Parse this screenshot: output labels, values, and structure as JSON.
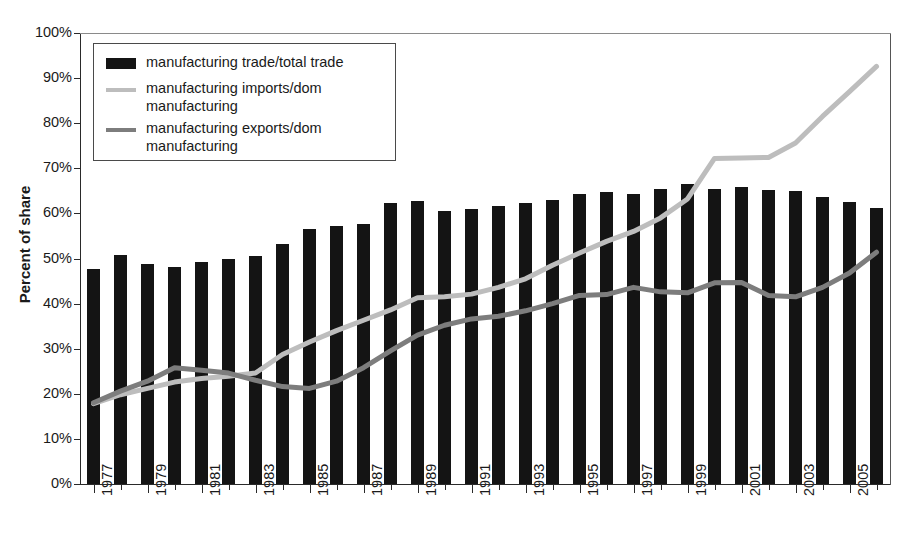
{
  "chart_data": {
    "type": "bar",
    "title": "",
    "xlabel": "",
    "ylabel": "Percent of share",
    "ylim": [
      0,
      100
    ],
    "ytick_labels": [
      "0%",
      "10%",
      "20%",
      "30%",
      "40%",
      "50%",
      "60%",
      "70%",
      "80%",
      "90%",
      "100%"
    ],
    "ytick_values": [
      0,
      10,
      20,
      30,
      40,
      50,
      60,
      70,
      80,
      90,
      100
    ],
    "grid": false,
    "legend_position": "upper-left inside plot",
    "categories": [
      1977,
      1978,
      1979,
      1980,
      1981,
      1982,
      1983,
      1984,
      1985,
      1986,
      1987,
      1988,
      1989,
      1990,
      1991,
      1992,
      1993,
      1994,
      1995,
      1996,
      1997,
      1998,
      1999,
      2000,
      2001,
      2002,
      2003,
      2004,
      2005,
      2006
    ],
    "xtick_labels": [
      "1977",
      "1979",
      "1981",
      "1983",
      "1985",
      "1987",
      "1989",
      "1991",
      "1993",
      "1995",
      "1997",
      "1999",
      "2001",
      "2003",
      "2005"
    ],
    "series": [
      {
        "name": "manufacturing trade/total trade",
        "kind": "bar",
        "color": "#141414",
        "values": [
          47.6,
          50.7,
          48.8,
          48.2,
          49.3,
          49.8,
          50.6,
          53.2,
          56.5,
          57.3,
          57.6,
          62.4,
          62.7,
          60.5,
          61.0,
          61.6,
          62.4,
          63.0,
          64.4,
          64.7,
          64.3,
          65.4,
          66.6,
          65.4,
          65.8,
          65.2,
          65.0,
          63.6,
          62.5,
          61.3
        ]
      },
      {
        "name": "manufacturing imports/dom manufacturing",
        "kind": "line",
        "color": "#bdbdbd",
        "values": [
          17.8,
          19.8,
          21.2,
          22.6,
          23.4,
          23.9,
          24.6,
          28.7,
          31.5,
          34.0,
          36.3,
          38.6,
          41.3,
          41.5,
          42.1,
          43.6,
          45.5,
          48.5,
          51.2,
          53.8,
          56.0,
          59.0,
          63.2,
          72.2,
          72.3,
          72.4,
          75.6,
          81.5,
          87.0,
          92.6
        ]
      },
      {
        "name": "manufacturing exports/dom manufacturing",
        "kind": "line",
        "color": "#7d7d7d",
        "values": [
          18.0,
          20.6,
          22.8,
          25.8,
          25.2,
          24.6,
          23.0,
          21.6,
          21.2,
          22.8,
          25.8,
          29.5,
          33.0,
          35.2,
          36.6,
          37.2,
          38.4,
          40.0,
          41.8,
          42.0,
          43.6,
          42.6,
          42.4,
          44.6,
          44.7,
          41.8,
          41.5,
          43.6,
          46.8,
          51.4
        ]
      }
    ]
  },
  "legend": {
    "items": [
      {
        "label": "manufacturing trade/total trade",
        "swatch": "bar"
      },
      {
        "label": "manufacturing imports/dom manufacturing",
        "swatch": "line-light"
      },
      {
        "label": "manufacturing exports/dom manufacturing",
        "swatch": "line-dark"
      }
    ]
  },
  "axis": {
    "y_title": "Percent of share"
  },
  "colors": {
    "bar": "#141414",
    "imports_line": "#bdbdbd",
    "exports_line": "#7d7d7d",
    "axis": "#2a2a2a",
    "text": "#1a1a1a"
  }
}
